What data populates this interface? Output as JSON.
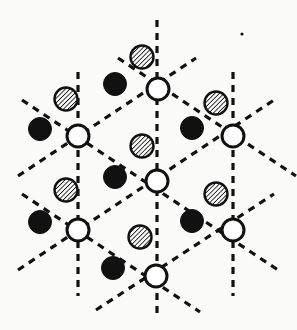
{
  "figure": {
    "canvas": {
      "width": 297,
      "height": 330
    },
    "background_color": "#fbfbfa",
    "ink_color": "#111111",
    "open_circle_fill": "#ffffff",
    "hatch_fill": "#ffffff",
    "filled_fill": "#111111",
    "dash_pattern": "7 6",
    "line_width": 3.2,
    "node_radius": 11,
    "node_stroke_width": 3.0,
    "atom_radius": 11.5,
    "hatch_angle_deg": 45,
    "hatch_spacing": 3.2,
    "lattice_spacing_x": 77,
    "lattice_spacing_y": 94
  },
  "legend_names": {
    "open_node": "open-circle-node",
    "filled_atom": "filled-black-atom",
    "hatched_atom": "hatched-atom",
    "mirror_line": "dashed-mirror-line"
  },
  "nodes": [
    {
      "id": "n-top-center",
      "x": 158,
      "y": 89,
      "type": "open"
    },
    {
      "id": "n-mid-left",
      "x": 78,
      "y": 136,
      "type": "open"
    },
    {
      "id": "n-mid-right",
      "x": 233,
      "y": 136,
      "type": "open"
    },
    {
      "id": "n-center",
      "x": 157,
      "y": 181,
      "type": "open"
    },
    {
      "id": "n-low-left",
      "x": 78,
      "y": 230,
      "type": "open"
    },
    {
      "id": "n-low-right",
      "x": 233,
      "y": 230,
      "type": "open"
    },
    {
      "id": "n-bottom-center",
      "x": 156,
      "y": 276,
      "type": "open"
    }
  ],
  "filled_atoms": [
    {
      "id": "f-1",
      "x": 115,
      "y": 84,
      "type": "filled"
    },
    {
      "id": "f-2",
      "x": 40,
      "y": 129,
      "type": "filled"
    },
    {
      "id": "f-3",
      "x": 192,
      "y": 128,
      "type": "filled"
    },
    {
      "id": "f-4",
      "x": 115,
      "y": 177,
      "type": "filled"
    },
    {
      "id": "f-5",
      "x": 40,
      "y": 222,
      "type": "filled"
    },
    {
      "id": "f-6",
      "x": 192,
      "y": 221,
      "type": "filled"
    },
    {
      "id": "f-7",
      "x": 113,
      "y": 268,
      "type": "filled"
    }
  ],
  "hatched_atoms": [
    {
      "id": "h-1",
      "x": 142,
      "y": 57,
      "type": "hatched"
    },
    {
      "id": "h-2",
      "x": 66,
      "y": 99,
      "type": "hatched"
    },
    {
      "id": "h-3",
      "x": 216,
      "y": 103,
      "type": "hatched"
    },
    {
      "id": "h-4",
      "x": 142,
      "y": 146,
      "type": "hatched"
    },
    {
      "id": "h-5",
      "x": 66,
      "y": 190,
      "type": "hatched"
    },
    {
      "id": "h-6",
      "x": 216,
      "y": 194,
      "type": "hatched"
    },
    {
      "id": "h-7",
      "x": 140,
      "y": 237,
      "type": "hatched"
    }
  ],
  "mirror_lines": [
    {
      "id": "m-v-left",
      "x1": 78,
      "y1": 72,
      "x2": 78,
      "y2": 296,
      "orientation": "vertical"
    },
    {
      "id": "m-v-center",
      "x1": 157,
      "y1": 20,
      "x2": 157,
      "y2": 318,
      "orientation": "vertical"
    },
    {
      "id": "m-v-right",
      "x1": 233,
      "y1": 72,
      "x2": 233,
      "y2": 296,
      "orientation": "vertical"
    },
    {
      "id": "m-d1-a",
      "x1": 18,
      "y1": 176,
      "x2": 196,
      "y2": 58,
      "orientation": "diagonal-up"
    },
    {
      "id": "m-d1-b",
      "x1": 18,
      "y1": 270,
      "x2": 274,
      "y2": 100,
      "orientation": "diagonal-up"
    },
    {
      "id": "m-d1-c",
      "x1": 96,
      "y1": 310,
      "x2": 274,
      "y2": 194,
      "orientation": "diagonal-up"
    },
    {
      "id": "m-d2-a",
      "x1": 118,
      "y1": 58,
      "x2": 296,
      "y2": 176,
      "orientation": "diagonal-down"
    },
    {
      "id": "m-d2-b",
      "x1": 22,
      "y1": 100,
      "x2": 278,
      "y2": 270,
      "orientation": "diagonal-down"
    },
    {
      "id": "m-d2-c",
      "x1": 22,
      "y1": 194,
      "x2": 200,
      "y2": 312,
      "orientation": "diagonal-down"
    }
  ],
  "speck": {
    "id": "ink-speck",
    "x": 242,
    "y": 34,
    "r": 1.6
  }
}
